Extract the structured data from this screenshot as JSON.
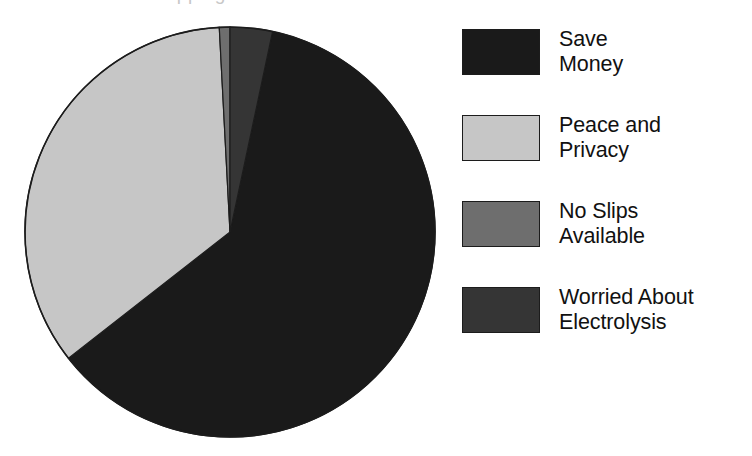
{
  "title_remnant": "stopping",
  "chart_data": {
    "type": "pie",
    "title": "",
    "subtitle": "",
    "xlabel": "",
    "ylabel": "",
    "legend_position": "right",
    "grid": false,
    "start_angle_deg": 12,
    "direction": "clockwise",
    "categories": [
      "Save Money",
      "Peace and Privacy",
      "No Slips Available",
      "Worried About Electrolysis"
    ],
    "values": [
      61.0,
      34.7,
      0.8,
      3.5
    ],
    "units": "percent",
    "slices": [
      {
        "label": "Save Money",
        "label_lines": "Save\nMoney",
        "value": 61.0,
        "color": "#1a1a1a",
        "start_deg": 12,
        "end_deg": 232
      },
      {
        "label": "Peace and Privacy",
        "label_lines": "Peace and\nPrivacy",
        "value": 34.7,
        "color": "#c6c6c6",
        "start_deg": 232,
        "end_deg": 357
      },
      {
        "label": "No Slips Available",
        "label_lines": "No Slips\nAvailable",
        "value": 0.8,
        "color": "#6e6e6e",
        "start_deg": 357,
        "end_deg": 360
      },
      {
        "label": "Worried About Electrolysis",
        "label_lines": "Worried About\nElectrolysis",
        "value": 3.5,
        "color": "#353535",
        "start_deg": 360,
        "end_deg": 372
      }
    ],
    "geometry": {
      "center_x": 230,
      "center_y": 232,
      "radius": 205,
      "outline_color": "#1c1c1c"
    }
  },
  "legend": {
    "items": [
      {
        "label": "Save\nMoney",
        "color": "#1a1a1a"
      },
      {
        "label": "Peace and\nPrivacy",
        "color": "#c6c6c6"
      },
      {
        "label": "No Slips\nAvailable",
        "color": "#6e6e6e"
      },
      {
        "label": "Worried About\nElectrolysis",
        "color": "#353535"
      }
    ]
  }
}
